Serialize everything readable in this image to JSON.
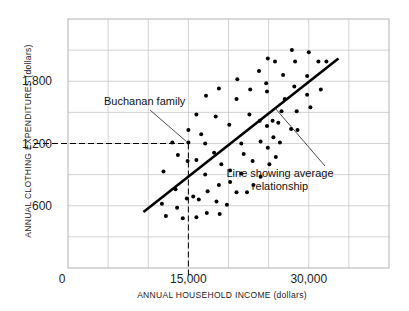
{
  "chart_data": {
    "type": "scatter",
    "title": "",
    "xlabel": "ANNUAL HOUSEHOLD INCOME (dollars)",
    "ylabel": "ANNUAL CLOTHING EXPENDITURES (dollars)",
    "xlim": [
      0,
      40000
    ],
    "ylim": [
      0,
      2400
    ],
    "grid": true,
    "origin_label": "0",
    "x_ticks": [
      {
        "value": 15000,
        "label": "15,000"
      },
      {
        "value": 30000,
        "label": "30,000"
      }
    ],
    "y_ticks": [
      {
        "value": 600,
        "label": "600"
      },
      {
        "value": 1200,
        "label": "1,200"
      },
      {
        "value": 1800,
        "label": "1,800"
      }
    ],
    "grid_x_step": 5000,
    "grid_y_step": 300,
    "trend_line": {
      "name": "Line showing average relationship",
      "x": [
        9400,
        33700
      ],
      "y": [
        540,
        2020
      ]
    },
    "highlight_point": {
      "name": "Buchanan family",
      "x": 15000,
      "y": 1200
    },
    "annotations": [
      {
        "text": "Buchanan family",
        "target": "highlight_point"
      },
      {
        "text": "Line showing average relationship",
        "target": "trend_line"
      }
    ],
    "series": [
      {
        "name": "Households",
        "points": [
          [
            13000,
            1210
          ],
          [
            13700,
            1090
          ],
          [
            11900,
            930
          ],
          [
            15000,
            1330
          ],
          [
            15000,
            1210
          ],
          [
            14900,
            1030
          ],
          [
            16000,
            1480
          ],
          [
            16600,
            1290
          ],
          [
            17100,
            1200
          ],
          [
            17200,
            1660
          ],
          [
            16000,
            1040
          ],
          [
            13400,
            760
          ],
          [
            11700,
            620
          ],
          [
            12200,
            500
          ],
          [
            13600,
            580
          ],
          [
            14300,
            480
          ],
          [
            14800,
            670
          ],
          [
            15600,
            690
          ],
          [
            16300,
            660
          ],
          [
            16000,
            490
          ],
          [
            17100,
            900
          ],
          [
            17400,
            740
          ],
          [
            17300,
            530
          ],
          [
            18200,
            1110
          ],
          [
            19100,
            1000
          ],
          [
            18800,
            800
          ],
          [
            18500,
            640
          ],
          [
            18900,
            520
          ],
          [
            18400,
            1460
          ],
          [
            18800,
            1730
          ],
          [
            19800,
            610
          ],
          [
            20100,
            1380
          ],
          [
            20200,
            940
          ],
          [
            20200,
            830
          ],
          [
            21000,
            730
          ],
          [
            21100,
            1820
          ],
          [
            21000,
            1630
          ],
          [
            21600,
            1200
          ],
          [
            21600,
            910
          ],
          [
            21900,
            1100
          ],
          [
            22300,
            730
          ],
          [
            22600,
            1480
          ],
          [
            22700,
            1720
          ],
          [
            23000,
            1030
          ],
          [
            23100,
            800
          ],
          [
            23900,
            1420
          ],
          [
            24000,
            1220
          ],
          [
            24000,
            880
          ],
          [
            23800,
            1900
          ],
          [
            24700,
            1780
          ],
          [
            24800,
            1700
          ],
          [
            24800,
            1370
          ],
          [
            24900,
            1160
          ],
          [
            25100,
            1000
          ],
          [
            25500,
            1420
          ],
          [
            25600,
            1260
          ],
          [
            25900,
            1070
          ],
          [
            26200,
            1400
          ],
          [
            26400,
            1210
          ],
          [
            24900,
            2020
          ],
          [
            25800,
            1990
          ],
          [
            26800,
            1860
          ],
          [
            27000,
            1630
          ],
          [
            26600,
            1510
          ],
          [
            27900,
            2100
          ],
          [
            28300,
            1990
          ],
          [
            28200,
            1750
          ],
          [
            28500,
            1510
          ],
          [
            27800,
            1340
          ],
          [
            28600,
            1330
          ],
          [
            29800,
            1850
          ],
          [
            29800,
            1670
          ],
          [
            30200,
            1550
          ],
          [
            30000,
            2080
          ],
          [
            31200,
            1990
          ],
          [
            32200,
            1990
          ],
          [
            31500,
            1720
          ]
        ]
      }
    ]
  }
}
